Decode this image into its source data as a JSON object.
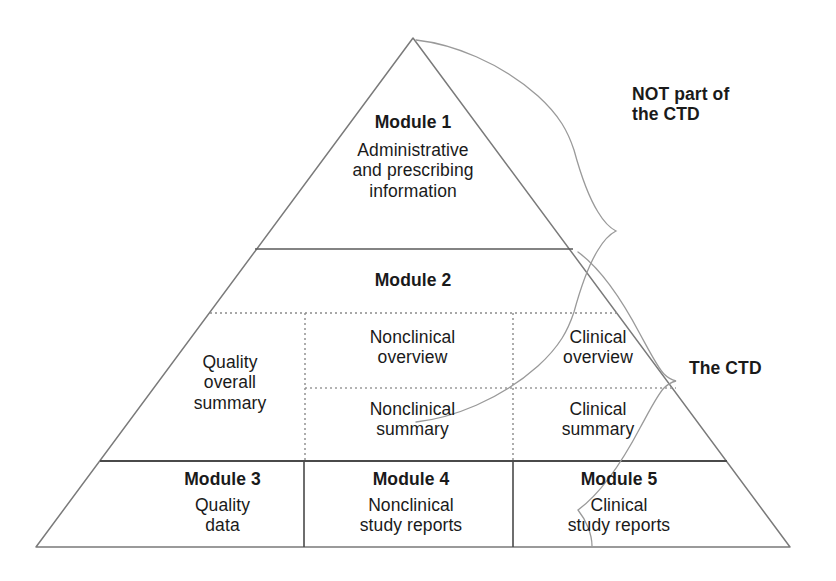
{
  "diagram": {
    "shape": "triangle",
    "line_color": "#6e6e6e",
    "text_color": "#1a1a1a",
    "background": "#ffffff"
  },
  "annotations": [
    {
      "id": "not-part-of-ctd",
      "text": "NOT part of\nthe CTD",
      "brace_covers": "Module 1"
    },
    {
      "id": "the-ctd",
      "text": "The CTD",
      "brace_covers": "Modules 2-5"
    }
  ],
  "tiers": {
    "module1": {
      "heading": "Module 1",
      "body": "Administrative\nand prescribing\ninformation"
    },
    "module2": {
      "heading": "Module 2",
      "columns": [
        {
          "id": "quality-overall-summary",
          "spans_rows": 2,
          "text": "Quality\noverall\nsummary"
        },
        {
          "id": "nonclinical",
          "overview": "Nonclinical\noverview",
          "summary": "Nonclinical\nsummary"
        },
        {
          "id": "clinical",
          "overview": "Clinical\noverview",
          "summary": "Clinical\nsummary"
        }
      ]
    },
    "base": [
      {
        "id": "module3",
        "heading": "Module 3",
        "body": "Quality\ndata"
      },
      {
        "id": "module4",
        "heading": "Module 4",
        "body": "Nonclinical\nstudy reports"
      },
      {
        "id": "module5",
        "heading": "Module 5",
        "body": "Clinical\nstudy reports"
      }
    ]
  }
}
